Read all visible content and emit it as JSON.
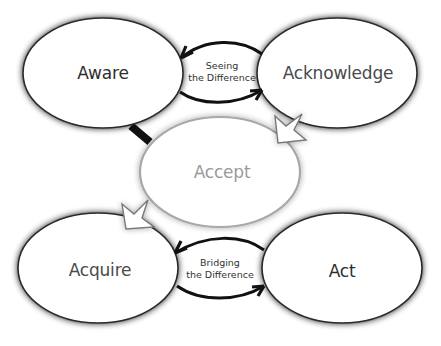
{
  "diagram": {
    "type": "process-cycle",
    "nodes": [
      {
        "id": "aware",
        "label": "Aware",
        "style": "dark",
        "cx": 103,
        "cy": 73,
        "rx": 80,
        "ry": 55
      },
      {
        "id": "acknowledge",
        "label": "Acknowledge",
        "style": "dark",
        "cx": 337,
        "cy": 73,
        "rx": 80,
        "ry": 55
      },
      {
        "id": "accept",
        "label": "Accept",
        "style": "light",
        "cx": 220,
        "cy": 172,
        "rx": 80,
        "ry": 55
      },
      {
        "id": "acquire",
        "label": "Acquire",
        "style": "dark",
        "cx": 98,
        "cy": 268,
        "rx": 80,
        "ry": 55
      },
      {
        "id": "act",
        "label": "Act",
        "style": "dark",
        "cx": 342,
        "cy": 268,
        "rx": 80,
        "ry": 55
      }
    ],
    "connectors": [
      {
        "id": "seeing",
        "caption_line1": "Seeing",
        "caption_line2": "the Difference",
        "between": [
          "aware",
          "acknowledge"
        ],
        "style": "bidirectional-black-arrows"
      },
      {
        "id": "bridging",
        "caption_line1": "Bridging",
        "caption_line2": "the Difference",
        "between": [
          "acquire",
          "act"
        ],
        "style": "bidirectional-black-arrows"
      },
      {
        "id": "aware-accept",
        "between": [
          "aware",
          "accept"
        ],
        "style": "thick-black-link"
      },
      {
        "id": "ack-accept",
        "between": [
          "acknowledge",
          "accept"
        ],
        "style": "hollow-arrow"
      },
      {
        "id": "accept-acquire",
        "between": [
          "accept",
          "acquire"
        ],
        "style": "hollow-arrow"
      }
    ],
    "colors": {
      "dark_stroke": "#2a2a2a",
      "light_stroke": "#a8a8a8",
      "arrow": "#111111",
      "fill": "#ffffff"
    }
  }
}
